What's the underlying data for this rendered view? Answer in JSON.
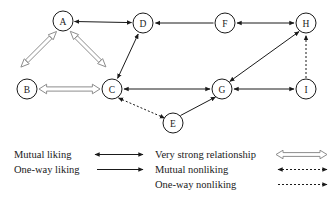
{
  "diagram": {
    "background_color": "#ffffff",
    "line_color": "#1a1a1a",
    "block_arrow_fill": "#ffffff",
    "block_arrow_stroke": "#8d8d8d",
    "nodes": [
      {
        "id": "A",
        "label": "A",
        "x": 63,
        "y": 21
      },
      {
        "id": "B",
        "label": "B",
        "x": 27,
        "y": 89
      },
      {
        "id": "C",
        "label": "C",
        "x": 112,
        "y": 89
      },
      {
        "id": "D",
        "label": "D",
        "x": 143,
        "y": 23
      },
      {
        "id": "E",
        "label": "E",
        "x": 173,
        "y": 123
      },
      {
        "id": "F",
        "label": "F",
        "x": 225,
        "y": 23
      },
      {
        "id": "G",
        "label": "G",
        "x": 222,
        "y": 89
      },
      {
        "id": "H",
        "label": "H",
        "x": 306,
        "y": 23
      },
      {
        "id": "I",
        "label": "I",
        "x": 306,
        "y": 89
      }
    ],
    "node_radius": 10,
    "edges": [
      {
        "from": "A",
        "to": "D",
        "type": "mutual-liking",
        "arrows": "both"
      },
      {
        "from": "F",
        "to": "D",
        "type": "one-way-liking",
        "arrows": "to"
      },
      {
        "from": "F",
        "to": "H",
        "type": "mutual-liking",
        "arrows": "both"
      },
      {
        "from": "C",
        "to": "D",
        "type": "mutual-liking",
        "arrows": "both"
      },
      {
        "from": "C",
        "to": "G",
        "type": "mutual-liking",
        "arrows": "both"
      },
      {
        "from": "G",
        "to": "I",
        "type": "mutual-liking",
        "arrows": "both"
      },
      {
        "from": "G",
        "to": "H",
        "type": "mutual-liking",
        "arrows": "both"
      },
      {
        "from": "E",
        "to": "G",
        "type": "one-way-liking",
        "arrows": "to"
      },
      {
        "from": "C",
        "to": "E",
        "type": "mutual-nonliking",
        "arrows": "both"
      },
      {
        "from": "I",
        "to": "H",
        "type": "one-way-nonliking",
        "arrows": "to"
      },
      {
        "from": "A",
        "to": "B",
        "type": "very-strong-relationship",
        "arrows": "both"
      },
      {
        "from": "A",
        "to": "C",
        "type": "very-strong-relationship",
        "arrows": "both"
      },
      {
        "from": "B",
        "to": "C",
        "type": "very-strong-relationship",
        "arrows": "both"
      }
    ]
  },
  "legend": {
    "left_column": [
      {
        "label": "Mutual liking",
        "symbol": "double-headed-solid-arrow"
      },
      {
        "label": "One-way liking",
        "symbol": "single-headed-solid-arrow"
      }
    ],
    "right_column": [
      {
        "label": "Very strong relationship",
        "symbol": "double-headed-block-arrow"
      },
      {
        "label": "Mutual nonliking",
        "symbol": "double-headed-dashed-arrow"
      },
      {
        "label": "One-way nonliking",
        "symbol": "single-headed-dashed-arrow"
      }
    ]
  }
}
